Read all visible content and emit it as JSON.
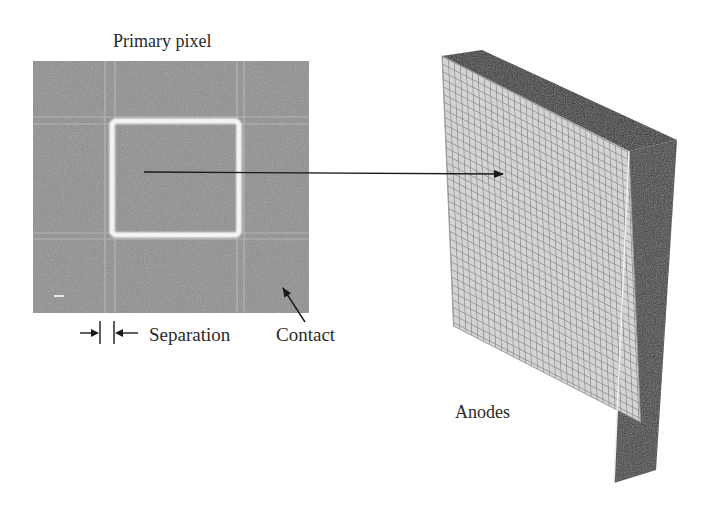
{
  "figure": {
    "labels": {
      "primary_pixel": "Primary pixel",
      "separation": "Separation",
      "contact": "Contact",
      "anodes": "Anodes"
    },
    "micrograph": {
      "background_color": "#8e8e8e",
      "pixel_outline_color": "#f4f4f4"
    },
    "anode_array": {
      "front_face_color": "#cfcfcf",
      "grid_line_color": "#8a8a8a",
      "side_color": "#3a3a3a",
      "top_color": "#2e2e2e",
      "columns": 32,
      "rows": 36
    },
    "icons": {
      "pointer_arrow": "arrow-right-icon",
      "contact_arrow": "arrow-up-left-icon",
      "separation_arrows": "dimension-arrows-icon"
    }
  }
}
